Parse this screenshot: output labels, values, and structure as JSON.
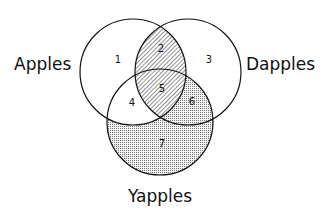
{
  "diagram": {
    "type": "venn",
    "sets": [
      {
        "id": "A",
        "label": "Apples"
      },
      {
        "id": "D",
        "label": "Dapples"
      },
      {
        "id": "Y",
        "label": "Yapples"
      }
    ],
    "regions": [
      {
        "label": "1",
        "sets": [
          "A"
        ],
        "shading": "none"
      },
      {
        "label": "2",
        "sets": [
          "A",
          "D"
        ],
        "shading": "hatched"
      },
      {
        "label": "3",
        "sets": [
          "D"
        ],
        "shading": "none"
      },
      {
        "label": "4",
        "sets": [
          "A",
          "Y"
        ],
        "shading": "none"
      },
      {
        "label": "5",
        "sets": [
          "A",
          "D",
          "Y"
        ],
        "shading": "hatched"
      },
      {
        "label": "6",
        "sets": [
          "D",
          "Y"
        ],
        "shading": "dotted"
      },
      {
        "label": "7",
        "sets": [
          "Y"
        ],
        "shading": "dotted"
      }
    ],
    "colors": {
      "stroke": "#111111",
      "background": "#ffffff"
    }
  }
}
